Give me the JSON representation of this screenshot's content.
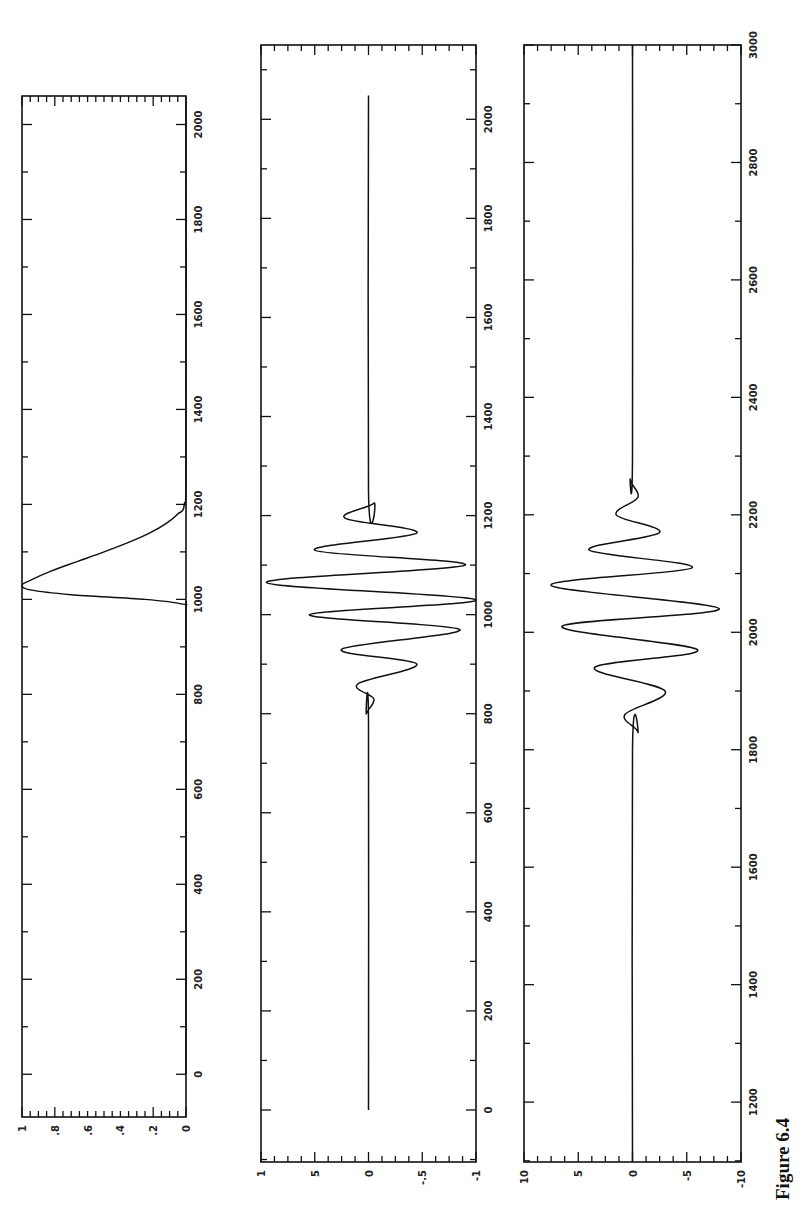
{
  "figure": {
    "caption": "Figure 6.4",
    "orientation": "rotated-90-ccw"
  },
  "chart_data": [
    {
      "type": "line",
      "title": "",
      "xlabel": "",
      "ylabel": "",
      "xlim": [
        -90,
        2060
      ],
      "ylim": [
        0,
        1
      ],
      "xticks": [
        0,
        200,
        400,
        600,
        800,
        1000,
        1200,
        1400,
        1600,
        1800,
        2000
      ],
      "yticks": [
        0,
        0.2,
        0.4,
        0.6,
        0.8,
        1
      ],
      "ytick_labels": [
        "0",
        ".2",
        ".4",
        ".6",
        ".8",
        "1"
      ],
      "description": "Asymmetric pulse: zero until ~990, sharp rise to peak 1.0 at ~1030, slow decay to 0 by ~1200, zero thereafter to 2048",
      "x": [
        0,
        900,
        980,
        990,
        1000,
        1010,
        1020,
        1030,
        1040,
        1060,
        1080,
        1100,
        1120,
        1140,
        1160,
        1180,
        1200,
        1300,
        2048
      ],
      "y": [
        0,
        0,
        0.0,
        0.02,
        0.25,
        0.7,
        0.95,
        1.0,
        0.95,
        0.82,
        0.66,
        0.5,
        0.35,
        0.22,
        0.12,
        0.05,
        0.01,
        0,
        0
      ]
    },
    {
      "type": "line",
      "title": "",
      "xlabel": "",
      "ylabel": "",
      "xlim": [
        -105,
        2150
      ],
      "ylim": [
        -1,
        1
      ],
      "xticks": [
        0,
        200,
        400,
        600,
        800,
        1000,
        1200,
        1400,
        1600,
        1800,
        2000
      ],
      "yticks": [
        -1,
        -0.5,
        0,
        0.5,
        1
      ],
      "ytick_labels": [
        "-1",
        "-.5",
        "0",
        "5",
        "1"
      ],
      "description": "Wave packet centered near 1030, oscillating between about -1 and +1, flat zero elsewhere (0 to 2048)",
      "x": [
        0,
        780,
        800,
        830,
        860,
        900,
        930,
        970,
        1000,
        1030,
        1065,
        1100,
        1130,
        1165,
        1195,
        1225,
        1250,
        2048
      ],
      "y": [
        0,
        0,
        0.02,
        -0.05,
        0.1,
        -0.45,
        0.25,
        -0.85,
        0.55,
        -1.0,
        0.95,
        -0.9,
        0.5,
        -0.45,
        0.22,
        -0.05,
        0,
        0
      ]
    },
    {
      "type": "line",
      "title": "",
      "xlabel": "",
      "ylabel": "",
      "xlim": [
        1098,
        3000
      ],
      "ylim": [
        -10,
        10
      ],
      "xticks": [
        1200,
        1400,
        1600,
        1800,
        2000,
        2200,
        2400,
        2600,
        2800,
        3000
      ],
      "yticks": [
        -10,
        -5,
        0,
        5,
        10
      ],
      "ytick_labels": [
        "-10",
        "-5",
        "0",
        "5",
        "10"
      ],
      "description": "Wave packet centered near 2030, amplitude about 8, flat zero elsewhere",
      "x": [
        1098,
        1800,
        1830,
        1860,
        1900,
        1940,
        1970,
        2010,
        2040,
        2080,
        2110,
        2140,
        2170,
        2200,
        2230,
        2260,
        2300,
        3000
      ],
      "y": [
        0,
        0,
        -0.5,
        0.7,
        -3.0,
        3.5,
        -6.0,
        6.5,
        -8.0,
        7.5,
        -5.5,
        4.0,
        -2.5,
        1.5,
        -0.5,
        0.2,
        0,
        0
      ]
    }
  ]
}
